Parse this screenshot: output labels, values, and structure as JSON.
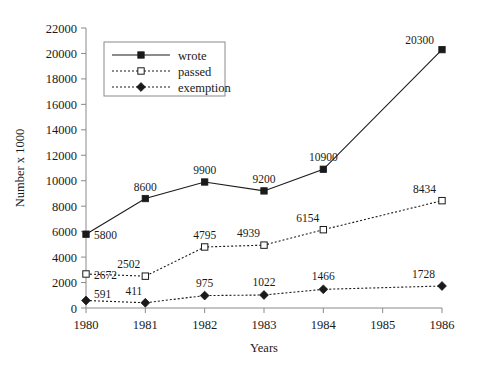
{
  "chart_data": {
    "type": "line",
    "title": "",
    "subtitle": "",
    "xlabel": "Years",
    "ylabel": "Number x 1000",
    "x": [
      1980,
      1981,
      1982,
      1983,
      1984,
      1985,
      1986
    ],
    "categories": [
      "1980",
      "1981",
      "1982",
      "1983",
      "1984",
      "1985",
      "1986"
    ],
    "xtick_labels": [
      "1980",
      "1981",
      "1982",
      "1983",
      "1984",
      "1985",
      "1986"
    ],
    "ytick_labels": [
      "0",
      "2000",
      "4000",
      "6000",
      "8000",
      "10000",
      "12000",
      "14000",
      "16000",
      "18000",
      "20000",
      "22000"
    ],
    "ytick_values": [
      0,
      2000,
      4000,
      6000,
      8000,
      10000,
      12000,
      14000,
      16000,
      18000,
      20000,
      22000
    ],
    "xlim": [
      1980,
      1986
    ],
    "ylim": [
      0,
      22000
    ],
    "grid": false,
    "legend_position": "top-left",
    "series": [
      {
        "name": "wrote",
        "style": "solid",
        "marker": "filled-square",
        "x": [
          1980,
          1981,
          1982,
          1983,
          1984,
          1986
        ],
        "values": [
          5800,
          8600,
          9900,
          9200,
          10900,
          20300
        ],
        "labels": [
          "5800",
          "8600",
          "9900",
          "9200",
          "10900",
          "20300"
        ]
      },
      {
        "name": "passed",
        "style": "dotted",
        "marker": "hollow-square",
        "x": [
          1980,
          1981,
          1982,
          1983,
          1984,
          1986
        ],
        "values": [
          2672,
          2502,
          4795,
          4939,
          6154,
          8434
        ],
        "labels": [
          "2672",
          "2502",
          "4795",
          "4939",
          "6154",
          "8434"
        ]
      },
      {
        "name": "exemption",
        "style": "dotted",
        "marker": "filled-diamond",
        "x": [
          1980,
          1981,
          1982,
          1983,
          1984,
          1986
        ],
        "values": [
          591,
          411,
          975,
          1022,
          1466,
          1728
        ],
        "labels": [
          "591",
          "411",
          "975",
          "1022",
          "1466",
          "1728"
        ]
      }
    ],
    "colors": {
      "line": "#1a1a1a",
      "axis": "#8a8a8a",
      "text": "#1a1a1a",
      "background": "#ffffff"
    }
  },
  "legend": {
    "items": [
      {
        "label": "wrote"
      },
      {
        "label": "passed"
      },
      {
        "label": "exemption"
      }
    ]
  },
  "axes": {
    "y_title": "Number x 1000",
    "x_title": "Years"
  }
}
